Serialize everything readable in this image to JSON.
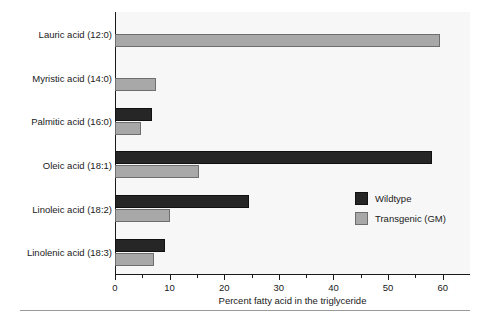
{
  "chart_data": {
    "type": "bar",
    "orientation": "horizontal",
    "title": "",
    "xlabel": "Percent fatty acid in the triglyceride",
    "ylabel": "",
    "xlim": [
      0,
      65
    ],
    "xticks": [
      0,
      10,
      20,
      30,
      40,
      50,
      60
    ],
    "grid": false,
    "legend_position": "center-right",
    "categories": [
      "Lauric acid (12:0)",
      "Myristic acid (14:0)",
      "Palmitic acid (16:0)",
      "Oleic acid (18:1)",
      "Linoleic acid (18:2)",
      "Linolenic acid (18:3)"
    ],
    "series": [
      {
        "name": "Wildtype",
        "color": "#262626",
        "values": [
          0,
          0,
          6.8,
          58.0,
          24.5,
          9.2
        ]
      },
      {
        "name": "Transgenic (GM)",
        "color": "#a8a8a8",
        "values": [
          59.5,
          7.5,
          4.8,
          15.3,
          10.1,
          7.2
        ]
      }
    ]
  },
  "legend": {
    "entries": [
      {
        "label": "Wildtype",
        "swatch": "wild"
      },
      {
        "label": "Transgenic (GM)",
        "swatch": "gm"
      }
    ]
  },
  "colors": {
    "wildtype": "#262626",
    "transgenic": "#a8a8a8",
    "axis": "#1a1a1a",
    "plot_background": "#f7f7f7"
  }
}
